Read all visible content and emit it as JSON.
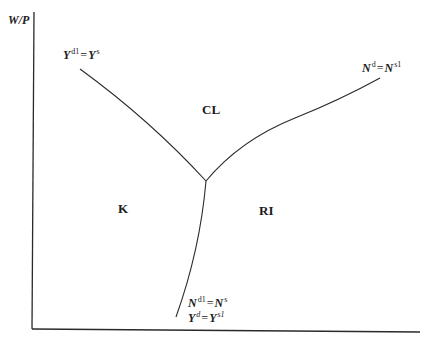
{
  "diagram": {
    "y_axis_label": "W/P",
    "x_axis_label": "",
    "regions": {
      "classical": "CL",
      "keynesian": "K",
      "repressed_inflation": "RI"
    },
    "curves": {
      "goods_market": {
        "lhs_base": "Y",
        "lhs_sup": "d1",
        "op": "=",
        "rhs_base": "Y",
        "rhs_sup": "s"
      },
      "labor_market": {
        "lhs_base": "N",
        "lhs_sup": "d",
        "op": "=",
        "rhs_base": "N",
        "rhs_sup": "s1"
      },
      "boundary_line1": {
        "lhs_base": "N",
        "lhs_sup": "d1",
        "op": "=",
        "rhs_base": "N",
        "rhs_sup": "s"
      },
      "boundary_line2": {
        "lhs_base": "Y",
        "lhs_sup": "d",
        "op": "=",
        "rhs_base": "Y",
        "rhs_sup": "s1"
      }
    },
    "colors": {
      "line": "#2a2a2a",
      "text": "#1c1c1c",
      "background": "#ffffff"
    }
  }
}
